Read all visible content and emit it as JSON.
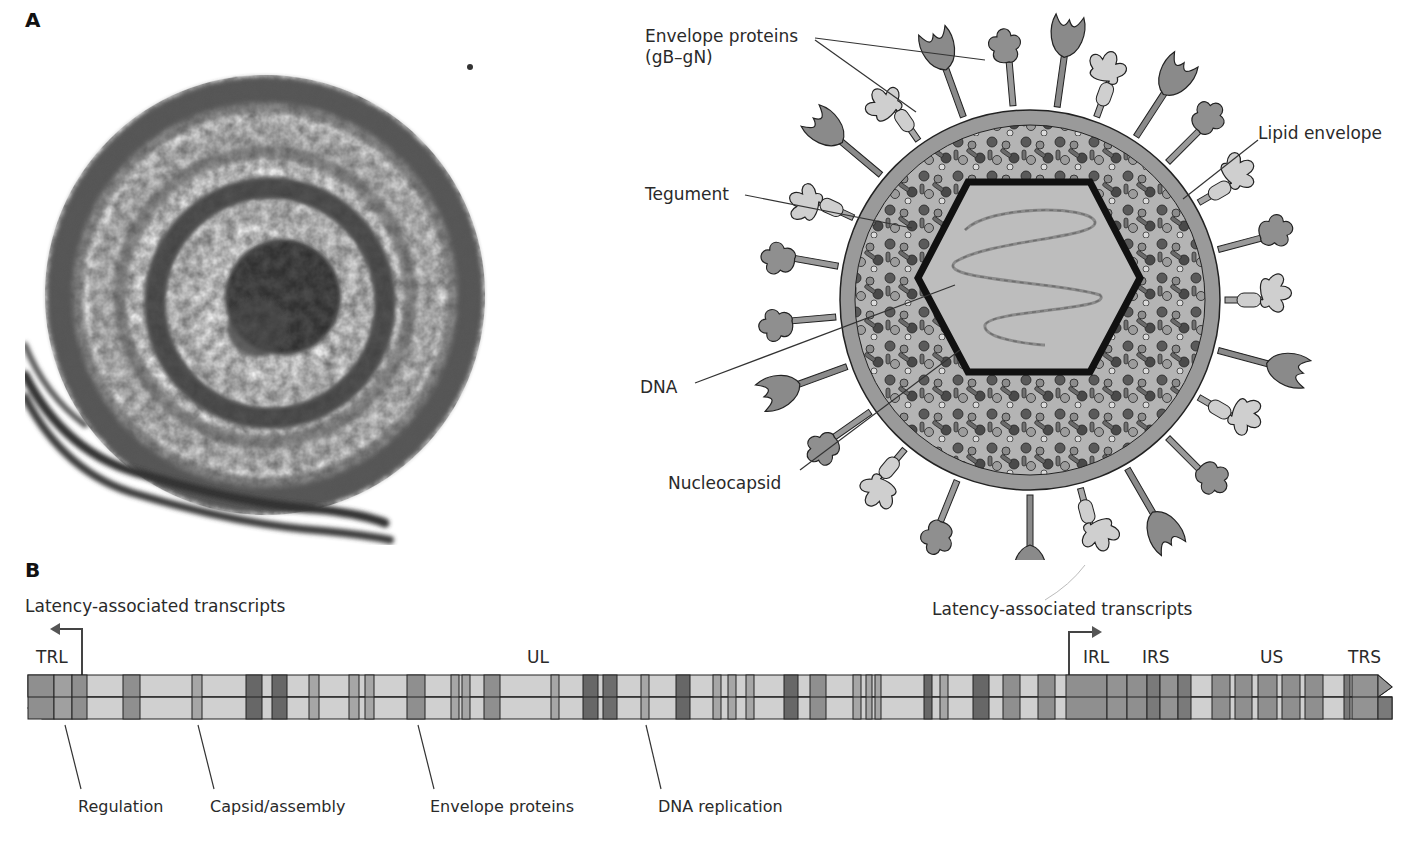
{
  "figure": {
    "panel_a": {
      "letter": "A",
      "micrograph": {
        "description": "electron micrograph of herpesvirus virion"
      },
      "diagram_labels": {
        "envelope_proteins": "Envelope proteins",
        "envelope_proteins_sub": "(gB–gN)",
        "tegument": "Tegument",
        "dna": "DNA",
        "nucleocapsid": "Nucleocapsid",
        "lipid_envelope": "Lipid envelope"
      }
    },
    "panel_b": {
      "letter": "B",
      "lat_left": "Latency-associated transcripts",
      "lat_right": "Latency-associated transcripts",
      "regions": {
        "trl": "TRL",
        "ul": "UL",
        "irl": "IRL",
        "irs": "IRS",
        "us": "US",
        "trs": "TRS"
      },
      "gene_classes": [
        {
          "label": "Regulation"
        },
        {
          "label": "Capsid/assembly"
        },
        {
          "label": "Envelope proteins"
        },
        {
          "label": "DNA replication"
        }
      ]
    },
    "colors": {
      "light": "#cfcfcf",
      "medium": "#8f8f8f",
      "mid2": "#a6a6a6",
      "dark": "#676767",
      "envelope_ring": "#9a9a9a",
      "capsid_fill": "#bdbdbd",
      "outline": "#111111"
    }
  }
}
